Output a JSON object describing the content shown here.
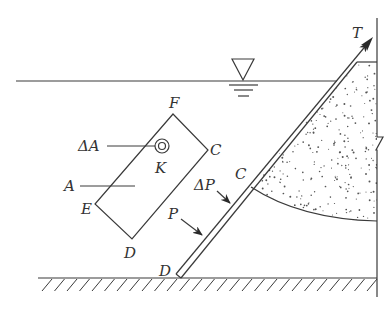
{
  "diagram": {
    "type": "hydrostatic pressure on inclined plate / gate",
    "labels": {
      "T": "T",
      "F": "F",
      "C_rect": "C",
      "delta_A": "ΔA",
      "K": "K",
      "A": "A",
      "E": "E",
      "D_rect": "D",
      "delta_P": "ΔP",
      "C_plate": "C",
      "P": "P",
      "D_plate": "D"
    },
    "symbols": {
      "free_surface": "water-level-triangle",
      "soil_fill": "stippled-backfill",
      "ground": "hatched-ground",
      "wall_break": "break-line"
    },
    "colors": {
      "line": "#3a3a3a",
      "text": "#333333",
      "background": "#ffffff"
    }
  }
}
